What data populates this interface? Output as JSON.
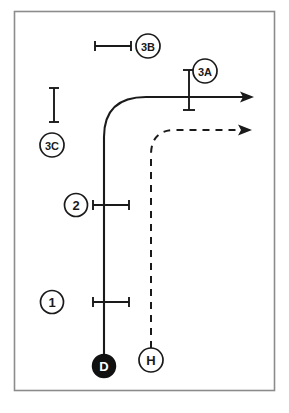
{
  "figure": {
    "background_color": "#ffffff",
    "border_color": "#8c8c8c",
    "stroke_color": "#1a1a1a",
    "marker_fill_dark": "#111111",
    "marker_text_light": "#ffffff"
  },
  "markers": [
    {
      "id": "marker-d",
      "label": "D",
      "style": "filled",
      "cx": 104,
      "cy": 366,
      "r": 11.5,
      "font_size": 13
    },
    {
      "id": "marker-h",
      "label": "H",
      "style": "outline",
      "cx": 151,
      "cy": 360,
      "r": 12,
      "font_size": 13
    }
  ],
  "callouts": [
    {
      "id": "callout-3b",
      "label": "3B",
      "cx": 148,
      "cy": 46,
      "r": 12,
      "font_size": 11
    },
    {
      "id": "callout-3a",
      "label": "3A",
      "cx": 205,
      "cy": 71,
      "r": 12,
      "font_size": 11
    },
    {
      "id": "callout-3c",
      "label": "3C",
      "cx": 52,
      "cy": 145,
      "r": 12,
      "font_size": 11
    },
    {
      "id": "callout-2",
      "label": "2",
      "cx": 76,
      "cy": 205,
      "r": 11.5,
      "font_size": 13
    },
    {
      "id": "callout-1",
      "label": "1",
      "cx": 52,
      "cy": 302,
      "r": 11.5,
      "font_size": 13
    }
  ],
  "dimension_lines": [
    {
      "id": "dimension-3b",
      "orientation": "horizontal",
      "x1": 95,
      "x2": 131,
      "y": 46,
      "cap_half": 5
    },
    {
      "id": "dimension-3a",
      "orientation": "vertical",
      "x": 189,
      "y1": 70,
      "y2": 110,
      "cap_half": 6
    },
    {
      "id": "dimension-3c",
      "orientation": "vertical",
      "x": 54,
      "y1": 88,
      "y2": 122,
      "cap_half": 5
    },
    {
      "id": "dimension-2",
      "orientation": "horizontal",
      "x1": 93,
      "x2": 129,
      "y": 205,
      "cap_half": 5
    },
    {
      "id": "dimension-1",
      "orientation": "horizontal",
      "x1": 93,
      "x2": 129,
      "y": 302,
      "cap_half": 5
    }
  ],
  "paths": [
    {
      "id": "path-solid-turn",
      "style": "solid",
      "description": "outer vehicle tracking path from D turning right",
      "d": "M 104 355 L 104 137 Q 104 97 146 97 L 247 97",
      "arrow_x": 252,
      "arrow_y": 97
    },
    {
      "id": "path-dashed-turn",
      "style": "dashed",
      "description": "inner wheel tracking path from H turning right",
      "d": "M 151 348 L 151 155 Q 151 130 175 130 L 244 130",
      "arrow_x": 250,
      "arrow_y": 130
    }
  ],
  "border": {
    "x": 14,
    "y": 11,
    "width": 261,
    "height": 380
  }
}
